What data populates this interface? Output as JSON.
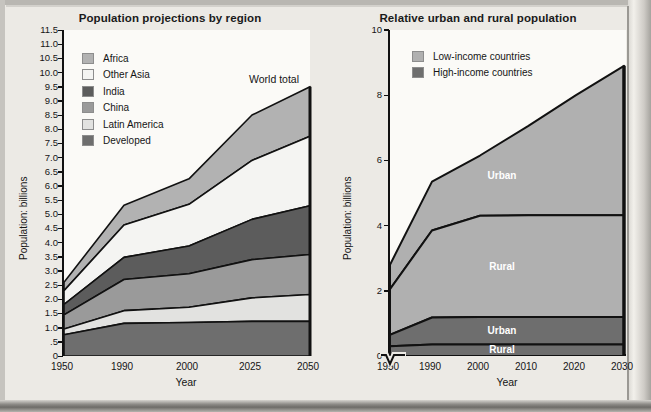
{
  "figure": {
    "background": "#eceae5",
    "plot_background": "#fbfaf7"
  },
  "charts": [
    {
      "id": "population-projections",
      "title": "Population projections by region",
      "xlabel": "Year",
      "ylabel": "Population: billions",
      "annotation": "World total",
      "legend": [
        {
          "label": "Africa",
          "color": "#b2b2b2"
        },
        {
          "label": "Other Asia",
          "color": "#f4f4f2"
        },
        {
          "label": "India",
          "color": "#5c5c5c"
        },
        {
          "label": "China",
          "color": "#9a9a9a"
        },
        {
          "label": "Latin America",
          "color": "#e2e2e0"
        },
        {
          "label": "Developed",
          "color": "#6e6e6e"
        }
      ],
      "yticks": [
        "11.5",
        "11.0",
        "10.5",
        "10.0",
        "9.5",
        "9.0",
        "8.5",
        "8.0",
        "7.5",
        "7.0",
        "6.5",
        "6.0",
        "5.5",
        "5.0",
        "4.5",
        "4.0",
        "3.5",
        "3.0",
        "2.5",
        "2.0",
        "1.5",
        "1.0",
        ".5",
        "0"
      ],
      "xticks": [
        "1950",
        "1990",
        "2000",
        "2025",
        "2050"
      ]
    },
    {
      "id": "urban-rural",
      "title": "Relative urban and rural population",
      "xlabel": "Year",
      "ylabel": "Population: billions",
      "legend": [
        {
          "label": "Low-income countries",
          "color": "#b0b0b0"
        },
        {
          "label": "High-income countries",
          "color": "#6e6e6e"
        }
      ],
      "band_labels": [
        "Urban",
        "Rural",
        "Urban",
        "Rural"
      ],
      "yticks": [
        "10",
        "8",
        "6",
        "4",
        "2",
        "0"
      ],
      "xticks": [
        "1950",
        "1990",
        "2000",
        "2010",
        "2020",
        "2030"
      ]
    }
  ],
  "chart_data": [
    {
      "type": "area",
      "id": "population-projections",
      "title": "Population projections by region",
      "xlabel": "Year",
      "ylabel": "Population: billions",
      "x": [
        1950,
        1990,
        2000,
        2025,
        2050
      ],
      "xlim": [
        1950,
        2050
      ],
      "ylim": [
        0,
        11.5
      ],
      "grid": false,
      "legend_position": "inside-top-left",
      "stacked": true,
      "annotations": [
        {
          "text": "World total",
          "x": 2040,
          "y": 10.1
        }
      ],
      "series": [
        {
          "name": "Developed",
          "color": "#6e6e6e",
          "values": [
            0.75,
            1.15,
            1.18,
            1.22,
            1.22
          ]
        },
        {
          "name": "Latin America",
          "color": "#e2e2e0",
          "values": [
            0.95,
            1.6,
            1.72,
            2.05,
            2.17
          ]
        },
        {
          "name": "China",
          "color": "#9a9a9a",
          "values": [
            1.45,
            2.7,
            2.9,
            3.4,
            3.58
          ]
        },
        {
          "name": "India",
          "color": "#5c5c5c",
          "values": [
            1.82,
            3.48,
            3.88,
            4.82,
            5.3
          ]
        },
        {
          "name": "Other Asia",
          "color": "#f4f4f2",
          "values": [
            2.3,
            4.62,
            5.35,
            6.9,
            7.75
          ]
        },
        {
          "name": "Africa",
          "color": "#b2b2b2",
          "values": [
            2.6,
            5.32,
            6.25,
            8.5,
            9.5
          ]
        }
      ],
      "cumulative_note": "series values are cumulative upper boundaries of each stacked band (billions)"
    },
    {
      "type": "area",
      "id": "urban-rural",
      "title": "Relative urban and rural population",
      "xlabel": "Year",
      "ylabel": "Population: billions",
      "x": [
        1950,
        1990,
        2000,
        2010,
        2020,
        2030
      ],
      "xlim": [
        1950,
        2030
      ],
      "ylim": [
        0,
        10
      ],
      "grid": false,
      "legend_position": "inside-top-left",
      "axis_break": {
        "axis": "x",
        "between": [
          1950,
          1990
        ]
      },
      "stacked": true,
      "series": [
        {
          "name": "High-income rural",
          "color": "#6e6e6e",
          "values": [
            0.3,
            0.35,
            0.35,
            0.35,
            0.35,
            0.35
          ]
        },
        {
          "name": "High-income urban",
          "color": "#6e6e6e",
          "values": [
            0.65,
            1.18,
            1.2,
            1.2,
            1.2,
            1.2
          ]
        },
        {
          "name": "Low-income rural",
          "color": "#b0b0b0",
          "values": [
            2.05,
            3.85,
            4.3,
            4.32,
            4.32,
            4.32
          ]
        },
        {
          "name": "Low-income urban",
          "color": "#b0b0b0",
          "values": [
            2.8,
            5.35,
            6.15,
            7.05,
            8.0,
            8.9
          ]
        }
      ],
      "band_labels": [
        {
          "text": "Urban",
          "band": "Low-income urban",
          "x": 2005,
          "y": 5.5
        },
        {
          "text": "Rural",
          "band": "Low-income rural",
          "x": 2005,
          "y": 2.7
        },
        {
          "text": "Urban",
          "band": "High-income urban",
          "x": 2005,
          "y": 0.75
        },
        {
          "text": "Rural",
          "band": "High-income rural",
          "x": 2005,
          "y": 0.16
        }
      ],
      "cumulative_note": "series values are cumulative upper boundaries of each stacked band (billions)"
    }
  ]
}
